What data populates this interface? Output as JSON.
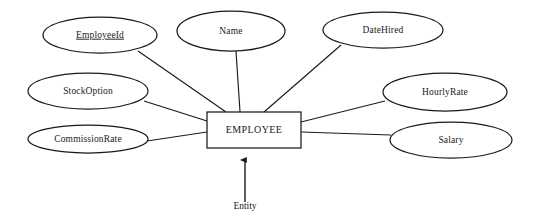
{
  "diagram": {
    "entity": {
      "name": "EMPLOYEE",
      "shape": "rectangle",
      "x": 207,
      "y": 112,
      "width": 94,
      "height": 36
    },
    "caption": {
      "label": "Entity",
      "x": 245,
      "y": 207,
      "arrow_from_y": 202,
      "arrow_to_y": 160
    },
    "attributes": [
      {
        "label": "EmployeeId",
        "primary_key": true,
        "cx": 100,
        "cy": 35,
        "rx": 57,
        "ry": 18,
        "link_from_x": 138,
        "link_from_y": 51,
        "link_to_x": 226,
        "link_to_y": 112
      },
      {
        "label": "Name",
        "primary_key": false,
        "cx": 231,
        "cy": 31,
        "rx": 54,
        "ry": 20,
        "link_from_x": 236,
        "link_from_y": 51,
        "link_to_x": 240,
        "link_to_y": 112
      },
      {
        "label": "DateHired",
        "primary_key": false,
        "cx": 383,
        "cy": 30,
        "rx": 60,
        "ry": 18,
        "link_from_x": 341,
        "link_from_y": 45,
        "link_to_x": 264,
        "link_to_y": 112
      },
      {
        "label": "StockOption",
        "primary_key": false,
        "cx": 88,
        "cy": 91,
        "rx": 60,
        "ry": 18,
        "link_from_x": 144,
        "link_from_y": 101,
        "link_to_x": 207,
        "link_to_y": 121
      },
      {
        "label": "CommissionRate",
        "primary_key": false,
        "cx": 88,
        "cy": 139,
        "rx": 60,
        "ry": 14,
        "link_from_x": 147,
        "link_from_y": 141,
        "link_to_x": 207,
        "link_to_y": 132
      },
      {
        "label": "HourlyRate",
        "primary_key": false,
        "cx": 445,
        "cy": 92,
        "rx": 62,
        "ry": 19,
        "link_from_x": 385,
        "link_from_y": 101,
        "link_to_x": 301,
        "link_to_y": 122
      },
      {
        "label": "Salary",
        "primary_key": false,
        "cx": 451,
        "cy": 140,
        "rx": 61,
        "ry": 18,
        "link_from_x": 391,
        "link_from_y": 135,
        "link_to_x": 301,
        "link_to_y": 132
      }
    ],
    "colors": {
      "background": "#ffffff",
      "stroke": "#1a1a1a",
      "text": "#1a1a1a",
      "fill": "#ffffff"
    }
  }
}
